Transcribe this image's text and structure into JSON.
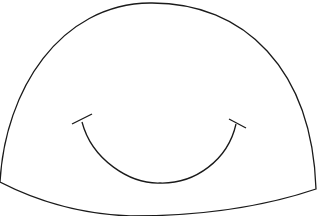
{
  "illustration": {
    "subject": "smiling dome character",
    "stroke_color": "#1a1a1a",
    "fill_color": "#ffffff",
    "background": "#ffffff"
  }
}
